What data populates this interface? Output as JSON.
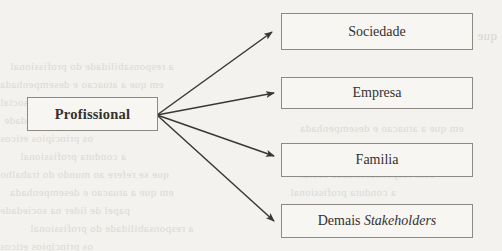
{
  "diagram": {
    "type": "fan-out-relationship-diagram",
    "background_color": "#f3f2ef",
    "box_border_color": "#8d8a85",
    "arrow_color": "#3a3834",
    "text_color": "#33312e",
    "source": {
      "label": "Profissional",
      "style": "bold"
    },
    "targets": [
      {
        "label": "Sociedade",
        "style": "regular"
      },
      {
        "label": "Empresa",
        "style": "regular"
      },
      {
        "label": "Familia",
        "style": "regular"
      },
      {
        "label_prefix": "Demais ",
        "label_italic": "Stakeholders",
        "style": "mixed"
      }
    ],
    "connections": [
      {
        "from": "Profissional",
        "to": "Sociedade",
        "arrow": "single-headed"
      },
      {
        "from": "Profissional",
        "to": "Empresa",
        "arrow": "single-headed"
      },
      {
        "from": "Profissional",
        "to": "Familia",
        "arrow": "single-headed"
      },
      {
        "from": "Profissional",
        "to": "Demais Stakeholders",
        "arrow": "single-headed"
      }
    ]
  },
  "background_ghost_text": {
    "note": "faint mirrored bleed-through from reverse page side",
    "lines": [
      "que se refere ao mundo do trabalho",
      "a responsabilidade do profissional",
      "em que a atuacao e desempenhada",
      "com responsabilidade social",
      "papel de lider na sociedade",
      "os principios eticos",
      "a conduta profissional"
    ]
  }
}
